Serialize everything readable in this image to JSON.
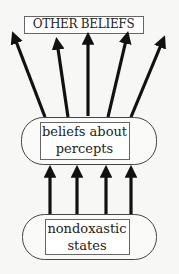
{
  "diagram": {
    "type": "flow",
    "nodes": [
      {
        "id": "other_beliefs",
        "label": "OTHER BELIEFS",
        "shape": "rectangle"
      },
      {
        "id": "beliefs_about_percepts",
        "label_line1": "beliefs about",
        "label_line2": "percepts",
        "shape": "rounded-stadium-with-inner-rectangle"
      },
      {
        "id": "nondoxastic_states",
        "label_line1": "nondoxastic",
        "label_line2": "states",
        "shape": "rounded-stadium-with-inner-rectangle"
      }
    ],
    "edges": [
      {
        "from": "beliefs_about_percepts",
        "to": "other_beliefs",
        "count": 5
      },
      {
        "from": "nondoxastic_states",
        "to": "beliefs_about_percepts",
        "count": 4
      }
    ],
    "colors": {
      "stroke": "#111111",
      "background": "#f7f7f5",
      "box_border": "#555555"
    }
  }
}
